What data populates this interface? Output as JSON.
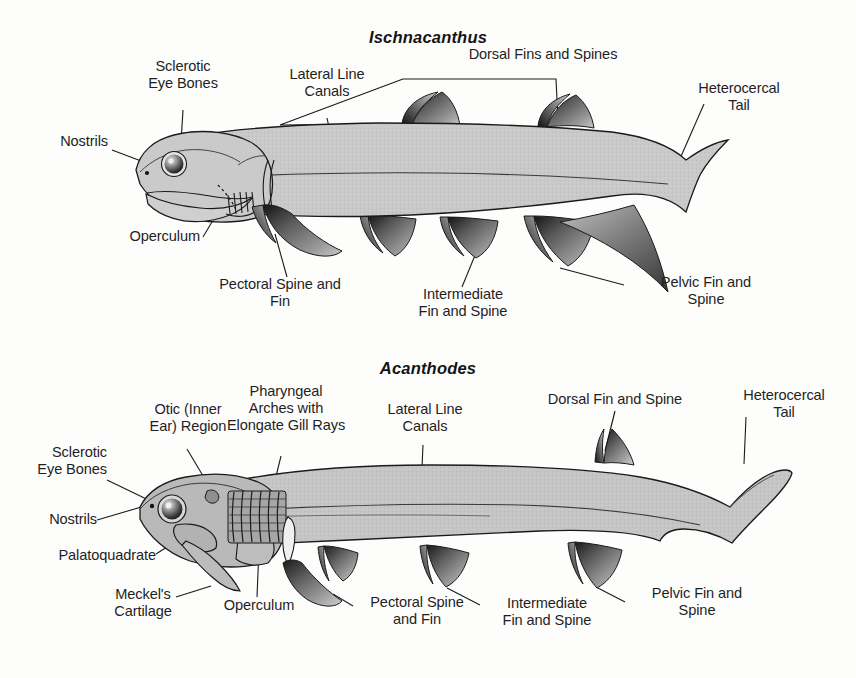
{
  "figure": {
    "background_color": "#fdfdfc",
    "body_fill_color": "#c9c9c9",
    "fin_dark_color": "#1d1d1d",
    "outline_color": "#1a1a1a",
    "text_color": "#1f1f1f"
  },
  "panels": [
    {
      "id": "ischnacanthus",
      "taxon": "Ischnacanthus",
      "labels": [
        {
          "name": "sclerotic-eye-bones",
          "text": "Sclerotic\nEye Bones"
        },
        {
          "name": "nostrils",
          "text": "Nostrils"
        },
        {
          "name": "operculum",
          "text": "Operculum"
        },
        {
          "name": "lateral-line-canals",
          "text": "Lateral Line\nCanals"
        },
        {
          "name": "dorsal-fins-and-spines",
          "text": "Dorsal Fins and Spines"
        },
        {
          "name": "heterocercal-tail",
          "text": "Heterocercal\nTail"
        },
        {
          "name": "pectoral-spine-and-fin",
          "text": "Pectoral Spine and\nFin"
        },
        {
          "name": "intermediate-fin-and-spine",
          "text": "Intermediate\nFin and Spine"
        },
        {
          "name": "pelvic-fin-and-spine",
          "text": "Pelvic Fin and\nSpine"
        }
      ]
    },
    {
      "id": "acanthodes",
      "taxon": "Acanthodes",
      "labels": [
        {
          "name": "otic-inner-ear-region",
          "text": "Otic (Inner\nEar) Region"
        },
        {
          "name": "pharyngeal-arches-with-elongate-gill-rays",
          "text": "Pharyngeal\nArches with\nElongate Gill Rays"
        },
        {
          "name": "lateral-line-canals",
          "text": "Lateral Line\nCanals"
        },
        {
          "name": "sclerotic-eye-bones",
          "text": "Sclerotic\nEye Bones"
        },
        {
          "name": "nostrils",
          "text": "Nostrils"
        },
        {
          "name": "palatoquadrate",
          "text": "Palatoquadrate"
        },
        {
          "name": "meckels-cartilage",
          "text": "Meckel's\nCartilage"
        },
        {
          "name": "operculum",
          "text": "Operculum"
        },
        {
          "name": "pectoral-spine-and-fin",
          "text": "Pectoral Spine\nand Fin"
        },
        {
          "name": "intermediate-fin-and-spine",
          "text": "Intermediate\nFin and Spine"
        },
        {
          "name": "dorsal-fin-and-spine",
          "text": "Dorsal Fin and Spine"
        },
        {
          "name": "heterocercal-tail",
          "text": "Heterocercal\nTail"
        },
        {
          "name": "pelvic-fin-and-spine",
          "text": "Pelvic Fin and\nSpine"
        }
      ]
    }
  ]
}
